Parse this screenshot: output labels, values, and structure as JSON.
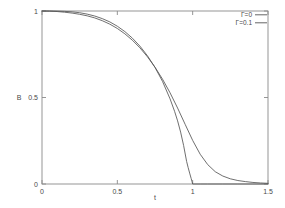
{
  "chart_data": {
    "type": "line",
    "title": "",
    "xlabel": "t",
    "ylabel": "B",
    "xlim": [
      0,
      1.5
    ],
    "ylim": [
      0,
      1
    ],
    "xticks": [
      "0",
      "0.5",
      "1",
      "1.5"
    ],
    "xtick_values": [
      0,
      0.5,
      1,
      1.5
    ],
    "yticks": [
      "0",
      "0.5",
      "1"
    ],
    "ytick_values": [
      0,
      0.5,
      1
    ],
    "grid": false,
    "legend_position": "top-right",
    "series": [
      {
        "name": "Γ=0",
        "color": "#555555",
        "x": [
          0,
          0.05,
          0.1,
          0.15,
          0.2,
          0.25,
          0.3,
          0.35,
          0.4,
          0.45,
          0.5,
          0.55,
          0.6,
          0.65,
          0.7,
          0.75,
          0.8,
          0.85,
          0.88,
          0.9,
          0.92,
          0.94,
          0.96,
          0.97,
          0.98,
          0.99,
          0.995,
          1.0,
          1.0,
          1.05,
          1.1,
          1.2,
          1.3,
          1.4,
          1.5
        ],
        "values": [
          1.0,
          1.0,
          0.9995,
          0.998,
          0.995,
          0.99,
          0.982,
          0.971,
          0.956,
          0.937,
          0.912,
          0.881,
          0.843,
          0.797,
          0.741,
          0.674,
          0.593,
          0.492,
          0.42,
          0.365,
          0.3,
          0.222,
          0.13,
          0.095,
          0.063,
          0.032,
          0.016,
          0.0,
          0.0,
          0.0,
          0.0,
          0.0,
          0.0,
          0.0,
          0.0
        ]
      },
      {
        "name": "Γ=0.1",
        "color": "#555555",
        "x": [
          0,
          0.05,
          0.1,
          0.15,
          0.2,
          0.25,
          0.3,
          0.35,
          0.4,
          0.45,
          0.5,
          0.55,
          0.6,
          0.65,
          0.7,
          0.75,
          0.8,
          0.85,
          0.9,
          0.95,
          1.0,
          1.05,
          1.1,
          1.15,
          1.2,
          1.25,
          1.3,
          1.35,
          1.4,
          1.45,
          1.5
        ],
        "values": [
          1.0,
          0.999,
          0.997,
          0.993,
          0.988,
          0.981,
          0.972,
          0.96,
          0.944,
          0.924,
          0.899,
          0.868,
          0.831,
          0.787,
          0.735,
          0.675,
          0.606,
          0.527,
          0.439,
          0.345,
          0.252,
          0.172,
          0.112,
          0.071,
          0.046,
          0.03,
          0.02,
          0.014,
          0.009,
          0.006,
          0.004
        ]
      }
    ]
  },
  "legend": {
    "entries": [
      {
        "label": "Γ=0"
      },
      {
        "label": "Γ=0.1"
      }
    ]
  },
  "axes": {
    "x_title": "t",
    "y_title": "B"
  }
}
